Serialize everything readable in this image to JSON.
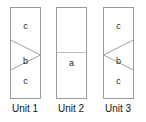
{
  "figure": {
    "type": "geometry-diagram",
    "background_color": "#ffffff",
    "line_color": "#9a9a9a",
    "text_color": "#1a1a1a"
  },
  "units": [
    {
      "caption": "Unit 1",
      "shape": "rectangle-with-right-pointing-triangle",
      "regions": [
        {
          "name": "top-region",
          "label": "c"
        },
        {
          "name": "triangle-region",
          "label": "b"
        },
        {
          "name": "bottom-region",
          "label": "c"
        }
      ]
    },
    {
      "caption": "Unit 2",
      "shape": "rectangle-with-horizontal-divider",
      "regions": [
        {
          "name": "top-region",
          "label": ""
        },
        {
          "name": "bottom-region",
          "label": "a"
        }
      ]
    },
    {
      "caption": "Unit 3",
      "shape": "rectangle-with-left-pointing-triangle",
      "regions": [
        {
          "name": "top-region",
          "label": "c"
        },
        {
          "name": "triangle-region",
          "label": "b"
        },
        {
          "name": "bottom-region",
          "label": "c"
        }
      ]
    }
  ]
}
